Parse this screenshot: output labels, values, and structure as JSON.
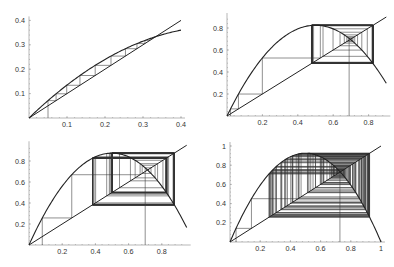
{
  "chart_data": [
    {
      "type": "line",
      "panel": "top-left",
      "title": "",
      "xlabel": "",
      "ylabel": "",
      "r": 1.5,
      "x0": 0.05,
      "iterations": 14,
      "xlim": [
        0,
        0.4
      ],
      "ylim": [
        0,
        0.4
      ],
      "curve_domain": [
        0,
        0.4
      ],
      "xticks": [
        0.1,
        0.2,
        0.3,
        0.4
      ],
      "xtick_labels": [
        "0.1",
        "0.2",
        "0.3",
        "0.4"
      ],
      "yticks": [
        0.1,
        0.2,
        0.3,
        0.4
      ],
      "ytick_labels": [
        "0.1",
        "0.2",
        "0.3",
        "0.4"
      ],
      "fixed_point": 0.333,
      "series": [
        {
          "name": "f(x) = 1.5 x (1 - x)",
          "kind": "parabola"
        },
        {
          "name": "y = x",
          "kind": "diagonal"
        },
        {
          "name": "cobweb",
          "kind": "cobweb"
        }
      ],
      "box": {
        "x0px": 29,
        "y0px": 118,
        "sx": 380,
        "sy": 244
      }
    },
    {
      "type": "line",
      "panel": "top-right",
      "title": "",
      "xlabel": "",
      "ylabel": "",
      "r": 3.3,
      "x0": 0.02,
      "iterations": 40,
      "xlim": [
        0,
        0.9
      ],
      "ylim": [
        0,
        0.9
      ],
      "curve_domain": [
        0,
        0.9
      ],
      "xticks": [
        0.2,
        0.4,
        0.6,
        0.8
      ],
      "xtick_labels": [
        "0.2",
        "0.4",
        "0.6",
        "0.8"
      ],
      "yticks": [
        0.2,
        0.4,
        0.6,
        0.8
      ],
      "ytick_labels": [
        "0.2",
        "0.4",
        "0.6",
        "0.8"
      ],
      "attractor": "2-cycle {0.479, 0.824}",
      "series": [
        {
          "name": "f(x) = 3.3 x (1 - x)",
          "kind": "parabola"
        },
        {
          "name": "y = x",
          "kind": "diagonal"
        },
        {
          "name": "cobweb",
          "kind": "cobweb"
        },
        {
          "name": "cobweb from fixed-point neighborhood",
          "kind": "cobweb",
          "x0": 0.69
        }
      ],
      "box": {
        "x0px": 227,
        "y0px": 116,
        "sx": 177,
        "sy": 110
      }
    },
    {
      "type": "line",
      "panel": "bottom-left",
      "title": "",
      "xlabel": "",
      "ylabel": "",
      "r": 3.5,
      "x0": 0.08,
      "iterations": 40,
      "xlim": [
        0,
        0.95
      ],
      "ylim": [
        0,
        0.95
      ],
      "curve_domain": [
        0,
        0.95
      ],
      "xticks": [
        0.2,
        0.4,
        0.6,
        0.8
      ],
      "xtick_labels": [
        "0.2",
        "0.4",
        "0.6",
        "0.8"
      ],
      "yticks": [
        0.2,
        0.4,
        0.6,
        0.8
      ],
      "ytick_labels": [
        "0.2",
        "0.4",
        "0.6",
        "0.8"
      ],
      "attractor": "4-cycle {0.383, 0.827, 0.501, 0.875}",
      "series": [
        {
          "name": "f(x) = 3.5 x (1 - x)",
          "kind": "parabola"
        },
        {
          "name": "y = x",
          "kind": "diagonal"
        },
        {
          "name": "cobweb",
          "kind": "cobweb"
        },
        {
          "name": "cobweb from fixed-point neighborhood",
          "kind": "cobweb",
          "x0": 0.7
        }
      ],
      "box": {
        "x0px": 29,
        "y0px": 245,
        "sx": 166,
        "sy": 105
      }
    },
    {
      "type": "line",
      "panel": "bottom-right",
      "title": "",
      "xlabel": "",
      "ylabel": "",
      "r": 3.7,
      "x0": 0.04,
      "iterations": 60,
      "xlim": [
        0,
        1
      ],
      "ylim": [
        0,
        1
      ],
      "curve_domain": [
        0,
        1
      ],
      "xticks": [
        0.2,
        0.4,
        0.6,
        0.8,
        1
      ],
      "xtick_labels": [
        "0.2",
        "0.4",
        "0.6",
        "0.8",
        "1"
      ],
      "yticks": [
        0.2,
        0.4,
        0.6,
        0.8,
        1
      ],
      "ytick_labels": [
        "0.2",
        "0.4",
        "0.6",
        "0.8",
        "1"
      ],
      "attractor": "chaotic band",
      "series": [
        {
          "name": "f(x) = 3.7 x (1 - x)",
          "kind": "parabola"
        },
        {
          "name": "y = x",
          "kind": "diagonal"
        },
        {
          "name": "cobweb",
          "kind": "cobweb"
        },
        {
          "name": "cobweb from fixed-point neighborhood",
          "kind": "cobweb",
          "x0": 0.728
        }
      ],
      "box": {
        "x0px": 230,
        "y0px": 242,
        "sx": 151,
        "sy": 96
      }
    }
  ]
}
